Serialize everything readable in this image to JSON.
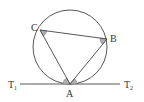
{
  "diagram": {
    "type": "circle-tangent-inscribed-triangle",
    "colors": {
      "stroke": "#444444",
      "angle_fill": "#b0b0b0",
      "text": "#333333",
      "background": "#ffffff"
    },
    "circle": {
      "cx": 70,
      "cy": 47,
      "r": 37
    },
    "points": {
      "A": {
        "x": 70,
        "y": 84,
        "label": "A"
      },
      "B": {
        "x": 107,
        "y": 39,
        "label": "B"
      },
      "C": {
        "x": 40,
        "y": 30,
        "label": "C"
      }
    },
    "tangent": {
      "x1": 20,
      "y1": 84,
      "x2": 120,
      "y2": 84,
      "left_label": "T",
      "left_sub": "1",
      "right_label": "T",
      "right_sub": "2"
    },
    "marked_angles": [
      "angle ACB",
      "angle ABC",
      "angle T1AC",
      "angle T2AB"
    ]
  }
}
